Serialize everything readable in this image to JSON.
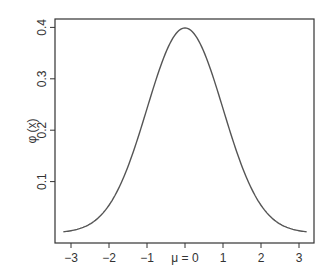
{
  "chart_data": {
    "type": "line",
    "title": "",
    "xlabel": "",
    "ylabel": "φ (x)",
    "xlim": [
      -3.35,
      3.45
    ],
    "ylim": [
      -0.02,
      0.41
    ],
    "grid": false,
    "legend": null,
    "x_ticks": [
      {
        "value": -3,
        "label": "−3"
      },
      {
        "value": -2,
        "label": "−2"
      },
      {
        "value": -1,
        "label": "−1"
      },
      {
        "value": 0,
        "label": "μ = 0"
      },
      {
        "value": 1,
        "label": "1"
      },
      {
        "value": 2,
        "label": "2"
      },
      {
        "value": 3,
        "label": "3"
      }
    ],
    "y_ticks": [
      {
        "value": 0.1,
        "label": "0.1"
      },
      {
        "value": 0.2,
        "label": "0.2"
      },
      {
        "value": 0.3,
        "label": "0.3"
      },
      {
        "value": 0.4,
        "label": "0.4"
      }
    ],
    "series": [
      {
        "name": "standard normal density",
        "color": "#555555",
        "x": [
          -3.2,
          -3.0,
          -2.8,
          -2.6,
          -2.4,
          -2.2,
          -2.0,
          -1.8,
          -1.6,
          -1.4,
          -1.2,
          -1.0,
          -0.8,
          -0.6,
          -0.4,
          -0.2,
          0.0,
          0.2,
          0.4,
          0.6,
          0.8,
          1.0,
          1.2,
          1.4,
          1.6,
          1.8,
          2.0,
          2.2,
          2.4,
          2.6,
          2.8,
          3.0,
          3.2
        ],
        "y": [
          0.0024,
          0.0044,
          0.0079,
          0.0136,
          0.0224,
          0.0355,
          0.054,
          0.079,
          0.1109,
          0.1497,
          0.1942,
          0.242,
          0.2897,
          0.3332,
          0.3683,
          0.391,
          0.3989,
          0.391,
          0.3683,
          0.3332,
          0.2897,
          0.242,
          0.1942,
          0.1497,
          0.1109,
          0.079,
          0.054,
          0.0355,
          0.0224,
          0.0136,
          0.0079,
          0.0044,
          0.0024
        ]
      }
    ]
  },
  "colors": {
    "axis": "#333333",
    "curve": "#555555"
  }
}
